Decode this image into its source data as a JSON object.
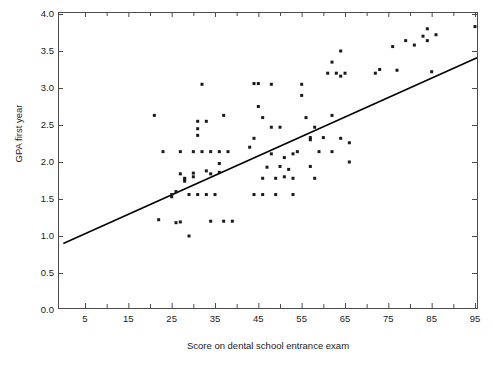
{
  "chart_data": {
    "type": "scatter",
    "title": "",
    "xlabel": "Score on dental school entrance exam",
    "ylabel": "GPA first year",
    "xlim": [
      0,
      97
    ],
    "ylim": [
      0.0,
      4.0
    ],
    "grid": false,
    "legend": null,
    "x_ticks": [
      5,
      15,
      25,
      35,
      45,
      55,
      65,
      75,
      85,
      95
    ],
    "x_tick_labels": [
      "5",
      "15",
      "25",
      "35",
      "45",
      "55",
      "65",
      "75",
      "85",
      "95"
    ],
    "x_minor_ticks": [
      10,
      20,
      30,
      40,
      50,
      60,
      70,
      80,
      90
    ],
    "y_ticks": [
      0.0,
      0.5,
      1.0,
      1.5,
      2.0,
      2.5,
      3.0,
      3.5,
      4.0
    ],
    "y_tick_labels": [
      "0.0",
      "0.5",
      "1.0",
      "1.5",
      "2.0",
      "2.5",
      "3.0",
      "3.5",
      "4.0"
    ],
    "marker": {
      "shape": "square",
      "size": 3,
      "color": "#1a1a1a"
    },
    "trendline": {
      "type": "linear-fit",
      "color": "#000000",
      "width": 1.6,
      "x_start": 0,
      "y_start": 0.9,
      "x_end": 97,
      "y_end": 3.45
    },
    "points": [
      [
        21,
        2.63
      ],
      [
        22,
        1.22
      ],
      [
        23,
        2.14
      ],
      [
        25,
        1.56
      ],
      [
        25,
        1.53
      ],
      [
        26,
        1.6
      ],
      [
        26,
        1.18
      ],
      [
        27,
        1.19
      ],
      [
        27,
        2.14
      ],
      [
        27,
        1.84
      ],
      [
        28,
        1.74
      ],
      [
        28,
        1.78
      ],
      [
        28,
        1.77
      ],
      [
        29,
        1.56
      ],
      [
        29,
        1.0
      ],
      [
        30,
        2.14
      ],
      [
        30,
        1.85
      ],
      [
        30,
        1.8
      ],
      [
        31,
        2.45
      ],
      [
        31,
        2.55
      ],
      [
        31,
        2.36
      ],
      [
        31,
        1.56
      ],
      [
        32,
        3.05
      ],
      [
        32,
        2.14
      ],
      [
        33,
        2.55
      ],
      [
        33,
        1.88
      ],
      [
        33,
        1.56
      ],
      [
        34,
        2.14
      ],
      [
        34,
        1.84
      ],
      [
        34,
        1.2
      ],
      [
        35,
        1.56
      ],
      [
        36,
        2.14
      ],
      [
        36,
        1.98
      ],
      [
        36,
        1.86
      ],
      [
        37,
        2.63
      ],
      [
        37,
        1.2
      ],
      [
        38,
        2.14
      ],
      [
        39,
        1.2
      ],
      [
        43,
        2.2
      ],
      [
        44,
        1.56
      ],
      [
        44,
        2.32
      ],
      [
        44,
        3.06
      ],
      [
        45,
        3.06
      ],
      [
        45,
        2.75
      ],
      [
        46,
        2.6
      ],
      [
        46,
        1.78
      ],
      [
        46,
        1.56
      ],
      [
        47,
        1.93
      ],
      [
        48,
        3.05
      ],
      [
        48,
        2.47
      ],
      [
        48,
        2.11
      ],
      [
        49,
        1.78
      ],
      [
        49,
        1.56
      ],
      [
        50,
        1.94
      ],
      [
        50,
        2.47
      ],
      [
        51,
        1.8
      ],
      [
        51,
        2.06
      ],
      [
        52,
        1.9
      ],
      [
        53,
        1.78
      ],
      [
        53,
        2.11
      ],
      [
        53,
        1.56
      ],
      [
        54,
        2.14
      ],
      [
        55,
        2.9
      ],
      [
        55,
        3.05
      ],
      [
        56,
        2.6
      ],
      [
        57,
        2.3
      ],
      [
        57,
        2.33
      ],
      [
        57,
        1.94
      ],
      [
        58,
        2.47
      ],
      [
        58,
        1.78
      ],
      [
        59,
        2.14
      ],
      [
        60,
        2.33
      ],
      [
        61,
        3.2
      ],
      [
        62,
        2.63
      ],
      [
        62,
        3.35
      ],
      [
        62,
        2.14
      ],
      [
        63,
        3.2
      ],
      [
        64,
        2.32
      ],
      [
        64,
        3.5
      ],
      [
        64,
        3.16
      ],
      [
        65,
        3.2
      ],
      [
        66,
        2.26
      ],
      [
        66,
        2.0
      ],
      [
        72,
        3.2
      ],
      [
        73,
        3.25
      ],
      [
        76,
        3.56
      ],
      [
        77,
        3.24
      ],
      [
        79,
        3.64
      ],
      [
        81,
        3.58
      ],
      [
        83,
        3.7
      ],
      [
        84,
        3.8
      ],
      [
        84,
        3.64
      ],
      [
        85,
        3.22
      ],
      [
        86,
        3.72
      ],
      [
        95,
        3.83
      ]
    ]
  },
  "axes": {
    "frame_color": "#4d4d4d",
    "tick_color": "#4d4d4d",
    "text_color": "#1a1a1a"
  }
}
